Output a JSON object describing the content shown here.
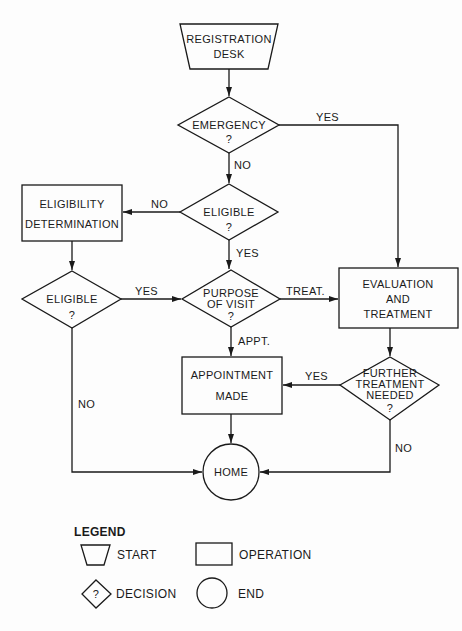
{
  "nodes": {
    "registration": {
      "type": "start",
      "line1": "REGISTRATION",
      "line2": "DESK"
    },
    "emergency": {
      "type": "decision",
      "line1": "EMERGENCY",
      "line2": "?"
    },
    "eligible_center": {
      "type": "decision",
      "line1": "ELIGIBLE",
      "line2": "?"
    },
    "eligibility_determination": {
      "type": "operation",
      "line1": "ELIGIBILITY",
      "line2": "DETERMINATION"
    },
    "eligible_left": {
      "type": "decision",
      "line1": "ELIGIBLE",
      "line2": "?"
    },
    "purpose": {
      "type": "decision",
      "line1": "PURPOSE",
      "line2": "OF VISIT",
      "line3": "?"
    },
    "evaluation": {
      "type": "operation",
      "line1": "EVALUATION",
      "line2": "AND",
      "line3": "TREATMENT"
    },
    "appointment": {
      "type": "operation",
      "line1": "APPOINTMENT",
      "line2": "MADE"
    },
    "further": {
      "type": "decision",
      "line1": "FURTHER",
      "line2": "TREATMENT",
      "line3": "NEEDED",
      "line4": "?"
    },
    "home": {
      "type": "end",
      "line1": "HOME"
    }
  },
  "edges": {
    "emergency_yes": "YES",
    "emergency_no": "NO",
    "eligible_center_no": "NO",
    "eligible_center_yes": "YES",
    "eligible_left_yes": "YES",
    "eligible_left_no": "NO",
    "purpose_treat": "TREAT.",
    "purpose_appt": "APPT.",
    "further_yes": "YES",
    "further_no": "NO"
  },
  "legend": {
    "title": "LEGEND",
    "start": "START",
    "operation": "OPERATION",
    "decision": "DECISION",
    "decision_symbol": "?",
    "end": "END"
  }
}
